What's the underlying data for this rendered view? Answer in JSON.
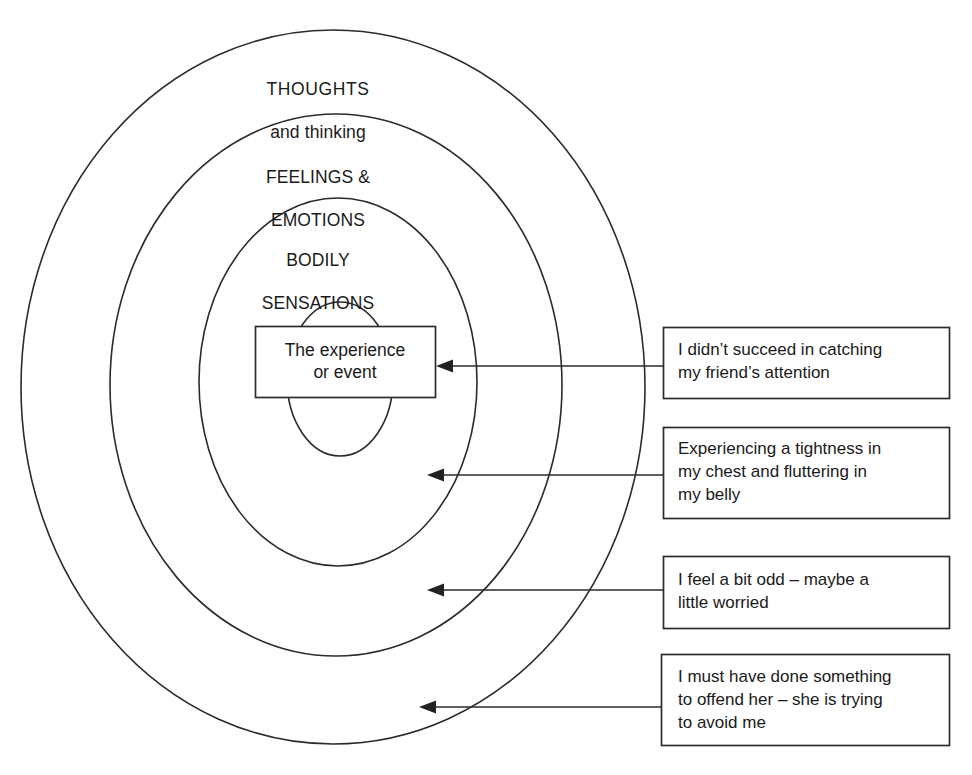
{
  "diagram": {
    "title_present": false,
    "rings": [
      {
        "id": "thoughts",
        "label_line1": "THOUGHTS",
        "label_line2": "and thinking"
      },
      {
        "id": "feelings",
        "label_line1": "FEELINGS &",
        "label_line2": "EMOTIONS"
      },
      {
        "id": "bodily",
        "label_line1": "BODILY",
        "label_line2": "SENSATIONS"
      }
    ],
    "center": {
      "line1": "The experience",
      "line2": "or event"
    },
    "callouts": [
      {
        "id": "event-callout",
        "lines": [
          "I didn’t succeed in catching",
          "my friend’s attention"
        ]
      },
      {
        "id": "bodily-callout",
        "lines": [
          "Experiencing a tightness in",
          "my chest and fluttering in",
          "my belly"
        ]
      },
      {
        "id": "feelings-callout",
        "lines": [
          "I feel a bit odd – maybe a",
          "little worried"
        ]
      },
      {
        "id": "thoughts-callout",
        "lines": [
          "I must have done something",
          "to offend her – she is trying",
          "to avoid me"
        ]
      }
    ],
    "colors": {
      "stroke": "#2b2b2b",
      "text": "#1a1a1a",
      "background": "#ffffff"
    }
  }
}
